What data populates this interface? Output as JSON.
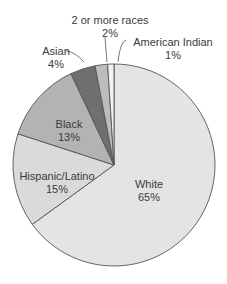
{
  "chart_data": {
    "type": "pie",
    "title": "",
    "start_angle_deg": 0,
    "direction": "clockwise",
    "slices": [
      {
        "label": "White",
        "value": 65,
        "pct_label": "65%",
        "color": "#e4e4e4"
      },
      {
        "label": "Hispanic/Latino",
        "value": 15,
        "pct_label": "15%",
        "color": "#dadada"
      },
      {
        "label": "Black",
        "value": 13,
        "pct_label": "13%",
        "color": "#b3b3b3"
      },
      {
        "label": "Asian",
        "value": 4,
        "pct_label": "4%",
        "color": "#6f6f6f"
      },
      {
        "label": "2 or more races",
        "value": 2,
        "pct_label": "2%",
        "color": "#bcbcbc"
      },
      {
        "label": "American Indian",
        "value": 1,
        "pct_label": "1%",
        "color": "#f2f2f2"
      }
    ],
    "unit": "%",
    "legend": "none (direct labels)"
  },
  "labels": {
    "white": {
      "name": "White",
      "pct": "65%"
    },
    "hispanic": {
      "name": "Hispanic/Latino",
      "pct": "15%"
    },
    "black": {
      "name": "Black",
      "pct": "13%"
    },
    "asian": {
      "name": "Asian",
      "pct": "4%"
    },
    "two_more": {
      "name": "2 or more races",
      "pct": "2%"
    },
    "american_indian": {
      "name": "American Indian",
      "pct": "1%"
    }
  }
}
